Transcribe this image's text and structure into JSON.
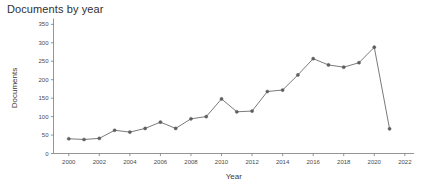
{
  "chart_data": {
    "type": "line",
    "title": "Documents by year",
    "xlabel": "Year",
    "ylabel": "Documents",
    "x": [
      2000,
      2001,
      2002,
      2003,
      2004,
      2005,
      2006,
      2007,
      2008,
      2009,
      2010,
      2011,
      2012,
      2013,
      2014,
      2015,
      2016,
      2017,
      2018,
      2019,
      2020,
      2021
    ],
    "values": [
      40,
      38,
      41,
      63,
      58,
      68,
      85,
      68,
      94,
      100,
      148,
      113,
      115,
      168,
      172,
      213,
      257,
      240,
      234,
      246,
      288,
      67
    ],
    "series": [
      {
        "name": "Documents",
        "values": [
          40,
          38,
          41,
          63,
          58,
          68,
          85,
          68,
          94,
          100,
          148,
          113,
          115,
          168,
          172,
          213,
          257,
          240,
          234,
          246,
          288,
          67
        ]
      }
    ],
    "xlim": [
      1999,
      2022.6
    ],
    "ylim": [
      0,
      355
    ],
    "x_ticks": [
      2000,
      2002,
      2004,
      2006,
      2008,
      2010,
      2012,
      2014,
      2016,
      2018,
      2020,
      2022
    ],
    "x_tick_labels": [
      "2000",
      "2002",
      "2004",
      "2006",
      "2008",
      "2010",
      "2012",
      "2014",
      "2016",
      "2018",
      "2020",
      "2022"
    ],
    "y_ticks": [
      0,
      50,
      100,
      150,
      200,
      250,
      300,
      350
    ],
    "y_tick_labels": [
      "0",
      "50",
      "100",
      "150",
      "200",
      "250",
      "300",
      "350"
    ],
    "grid": false,
    "legend": null,
    "marker": "circle",
    "line_color": "#6b6b6b",
    "marker_color": "#5e5e5e",
    "background_color": "#ffffff"
  }
}
